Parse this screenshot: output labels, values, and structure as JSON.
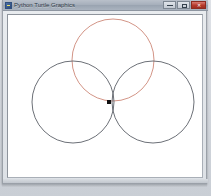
{
  "window": {
    "title": "Python Turtle Graphics",
    "app_icon": "python-icon",
    "controls": {
      "minimize_label": "—",
      "maximize_label": "□",
      "close_label": "✕"
    }
  },
  "canvas": {
    "background_color": "#ffffff",
    "width": 194,
    "height": 162,
    "turtle": {
      "x": 101,
      "y": 87,
      "color": "#111111",
      "size": 4,
      "shape": "turtle-marker"
    },
    "shapes": [
      {
        "name": "circle-top",
        "type": "circle",
        "cx": 105,
        "cy": 45,
        "r": 41,
        "stroke": "#cd8878",
        "stroke_width": 0.9
      },
      {
        "name": "circle-bottom-left",
        "type": "circle",
        "cx": 65,
        "cy": 87,
        "r": 41,
        "stroke": "#5b6068",
        "stroke_width": 0.9
      },
      {
        "name": "circle-bottom-right",
        "type": "circle",
        "cx": 145,
        "cy": 87,
        "r": 41,
        "stroke": "#5b6068",
        "stroke_width": 0.9
      }
    ]
  },
  "colors": {
    "accent_red": "#cd8878",
    "outline_gray": "#5b6068",
    "titlebar": "#a7b0bc",
    "close_button": "#b63a2c"
  }
}
